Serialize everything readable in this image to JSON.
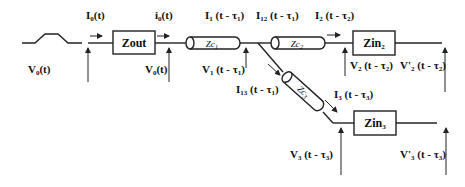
{
  "diagram": {
    "title": "",
    "source": {
      "label": "V",
      "sub": "0",
      "arg": "(t)"
    },
    "blocks": {
      "zout": {
        "label": "Zout"
      },
      "zin2": {
        "label": "Zin",
        "sub": "2"
      },
      "zin3": {
        "label": "Zin",
        "sub": "3"
      }
    },
    "lines": {
      "zc1": {
        "label": "Zc",
        "sub": "1"
      },
      "zc2": {
        "label": "Zc",
        "sub": "2"
      },
      "zc3": {
        "label": "Zc",
        "sub": "3"
      }
    },
    "currents": {
      "I0": {
        "label": "I",
        "sub": "0",
        "arg": "(t)"
      },
      "i0": {
        "label": "i",
        "sub": "0",
        "arg": "(t)"
      },
      "I1": {
        "label": "I",
        "sub": "1",
        "arg": " (t - τ",
        "argsub": "1",
        "close": ")"
      },
      "I12": {
        "label": "I",
        "sub": "12",
        "arg": " (t - τ",
        "argsub": "1",
        "close": ")"
      },
      "I2": {
        "label": "I",
        "sub": "2",
        "arg": " (t - τ",
        "argsub": "2",
        "close": ")"
      },
      "I13": {
        "label": "I",
        "sub": "13",
        "arg": " (t - τ",
        "argsub": "1",
        "close": ")"
      },
      "I3": {
        "label": "I",
        "sub": "3",
        "arg": " (t - τ",
        "argsub": "3",
        "close": ")"
      }
    },
    "voltages": {
      "V0": {
        "label": "V",
        "sub": "0",
        "arg": "(t)"
      },
      "V1": {
        "label": "V",
        "sub": "1",
        "arg": " (t - τ",
        "argsub": "1",
        "close": ")"
      },
      "V2": {
        "label": "V",
        "sub": "2",
        "arg": " (t - τ",
        "argsub": "2",
        "close": ")"
      },
      "V2p": {
        "label": "V'",
        "sub": "2",
        "arg": " (t - τ",
        "argsub": "2",
        "close": ")"
      },
      "V3": {
        "label": "V",
        "sub": "3",
        "arg": " (t - τ",
        "argsub": "3",
        "close": ")"
      },
      "V3p": {
        "label": "V'",
        "sub": "3",
        "arg": " (t - τ",
        "argsub": "3",
        "close": ")"
      }
    }
  }
}
